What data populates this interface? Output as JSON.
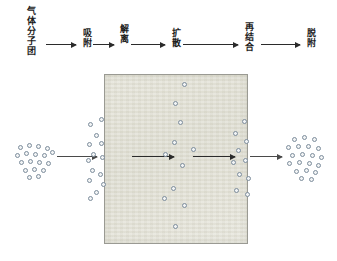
{
  "figure": {
    "type": "process-diagram",
    "title_text": "",
    "background_color": "#ffffff"
  },
  "stage": {
    "width": 337,
    "height": 261
  },
  "colors": {
    "membrane_fill": "#dedcd0",
    "membrane_border": "#9a9a93",
    "molecule_stroke": "#7d8d9c",
    "molecule_fill": "#f2f4f5",
    "arrow": "#2b2b2b",
    "text": "#1c1c1c"
  },
  "labels": [
    {
      "id": "gas-cluster",
      "text": "气体分子团",
      "x": 25,
      "y": 6,
      "chars": 5
    },
    {
      "id": "adsorption",
      "text": "吸附",
      "x": 81,
      "y": 28,
      "chars": 2
    },
    {
      "id": "dissociation",
      "text": "解离",
      "x": 118,
      "y": 24,
      "chars": 2
    },
    {
      "id": "diffusion",
      "text": "扩散",
      "x": 170,
      "y": 28,
      "chars": 2
    },
    {
      "id": "recombination",
      "text": "再结合",
      "x": 243,
      "y": 22,
      "chars": 3
    },
    {
      "id": "desorption",
      "text": "脱附",
      "x": 305,
      "y": 28,
      "chars": 2
    }
  ],
  "flow_arrows": [
    {
      "id": "arrow-1",
      "x": 46,
      "y": 44,
      "w": 30
    },
    {
      "id": "arrow-2",
      "x": 93,
      "y": 44,
      "w": 21
    },
    {
      "id": "arrow-3",
      "x": 131,
      "y": 44,
      "w": 34
    },
    {
      "id": "arrow-4",
      "x": 183,
      "y": 44,
      "w": 55
    },
    {
      "id": "arrow-5",
      "x": 261,
      "y": 44,
      "w": 39
    }
  ],
  "membrane": {
    "x": 104,
    "y": 74,
    "w": 142,
    "h": 168
  },
  "inner_arrows": [
    {
      "id": "inner-arrow-left",
      "x": 132,
      "y": 156,
      "w": 42
    },
    {
      "id": "inner-arrow-right",
      "x": 193,
      "y": 156,
      "w": 42
    }
  ],
  "bulk_arrows": [
    {
      "id": "feed-arrow",
      "x": 57,
      "y": 156,
      "w": 40
    },
    {
      "id": "permeate-arrow",
      "x": 250,
      "y": 156,
      "w": 32
    }
  ],
  "molecule_groups": {
    "feed_cluster": {
      "name": "gas-molecule-cluster-left",
      "points": [
        [
          18,
          145
        ],
        [
          27,
          143
        ],
        [
          36,
          144
        ],
        [
          45,
          146
        ],
        [
          15,
          153
        ],
        [
          24,
          151
        ],
        [
          33,
          152
        ],
        [
          42,
          153
        ],
        [
          50,
          150
        ],
        [
          19,
          160
        ],
        [
          28,
          159
        ],
        [
          37,
          160
        ],
        [
          46,
          161
        ],
        [
          23,
          168
        ],
        [
          32,
          167
        ],
        [
          41,
          168
        ],
        [
          27,
          175
        ],
        [
          36,
          174
        ]
      ]
    },
    "surface_left": {
      "name": "adsorbed-molecules-left-surface",
      "points": [
        [
          88,
          122
        ],
        [
          99,
          117
        ],
        [
          94,
          133
        ],
        [
          87,
          142
        ],
        [
          99,
          141
        ],
        [
          91,
          152
        ],
        [
          86,
          158
        ],
        [
          100,
          155
        ],
        [
          90,
          168
        ],
        [
          98,
          172
        ],
        [
          87,
          178
        ],
        [
          101,
          182
        ],
        [
          94,
          190
        ],
        [
          88,
          196
        ]
      ]
    },
    "inside_membrane": {
      "name": "molecules-inside-membrane",
      "points": [
        [
          182,
          82
        ],
        [
          173,
          101
        ],
        [
          178,
          120
        ],
        [
          172,
          140
        ],
        [
          180,
          163
        ],
        [
          171,
          186
        ],
        [
          182,
          203
        ],
        [
          173,
          224
        ],
        [
          163,
          152
        ],
        [
          191,
          147
        ],
        [
          162,
          196
        ]
      ]
    },
    "surface_right": {
      "name": "recombined-molecules-right-surface",
      "points": [
        [
          242,
          119
        ],
        [
          233,
          131
        ],
        [
          244,
          139
        ],
        [
          236,
          148
        ],
        [
          231,
          160
        ],
        [
          243,
          158
        ],
        [
          237,
          172
        ],
        [
          246,
          176
        ],
        [
          234,
          188
        ],
        [
          245,
          192
        ]
      ]
    },
    "permeate_cluster": {
      "name": "gas-molecule-cluster-right",
      "points": [
        [
          292,
          137
        ],
        [
          302,
          135
        ],
        [
          312,
          137
        ],
        [
          286,
          145
        ],
        [
          296,
          144
        ],
        [
          306,
          144
        ],
        [
          316,
          146
        ],
        [
          290,
          153
        ],
        [
          300,
          152
        ],
        [
          310,
          153
        ],
        [
          319,
          155
        ],
        [
          287,
          161
        ],
        [
          297,
          160
        ],
        [
          307,
          161
        ],
        [
          316,
          163
        ],
        [
          294,
          169
        ],
        [
          304,
          168
        ],
        [
          313,
          170
        ],
        [
          299,
          176
        ],
        [
          309,
          177
        ]
      ]
    }
  }
}
